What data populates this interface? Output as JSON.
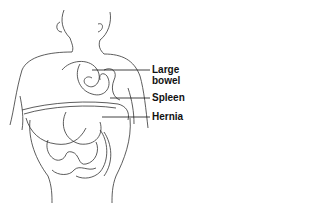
{
  "diagram": {
    "labels": [
      {
        "text": "Large",
        "text2": "bowel"
      },
      {
        "text": "Spleen"
      },
      {
        "text": "Hernia"
      }
    ],
    "colors": {
      "line": "#222222",
      "background": "#ffffff"
    }
  }
}
